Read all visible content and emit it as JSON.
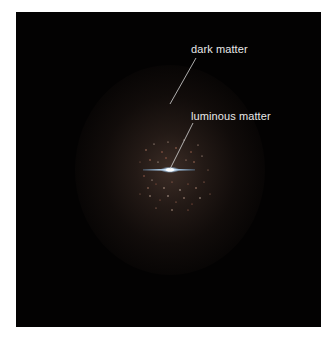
{
  "diagram": {
    "background_color": "#030202",
    "halo_color": "#463428",
    "disk_color": "#9ec4e6",
    "labels": [
      {
        "id": "dark-matter",
        "text": "dark matter"
      },
      {
        "id": "luminous-matter",
        "text": "luminous matter"
      }
    ]
  }
}
